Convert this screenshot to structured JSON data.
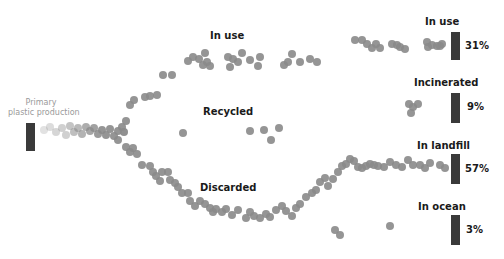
{
  "source": {
    "label_line1": "Primary",
    "label_line2": "plastic production"
  },
  "flow_labels": {
    "in_use": "In use",
    "recycled": "Recycled",
    "discarded": "Discarded"
  },
  "outcomes": [
    {
      "label": "In use",
      "percent": "31%"
    },
    {
      "label": "Incinerated",
      "percent": "9%"
    },
    {
      "label": "In landfill",
      "percent": "57%"
    },
    {
      "label": "In ocean",
      "percent": "3%"
    }
  ],
  "colors": {
    "bar": "#3a3a3a",
    "dot": "#8a8a8a",
    "label": "#1a1a1a",
    "source_label": "#9a9a9a"
  },
  "chart_data": {
    "type": "flow",
    "title": "",
    "source": "Primary plastic production",
    "paths": [
      "In use",
      "Recycled",
      "Discarded"
    ],
    "outcomes": [
      {
        "name": "In use",
        "value": 31
      },
      {
        "name": "Incinerated",
        "value": 9
      },
      {
        "name": "In landfill",
        "value": 57
      },
      {
        "name": "In ocean",
        "value": 3
      }
    ],
    "unit": "%"
  },
  "dots": [
    [
      44,
      130,
      0.25
    ],
    [
      50,
      127,
      0.3
    ],
    [
      56,
      132,
      0.35
    ],
    [
      62,
      128,
      0.4
    ],
    [
      66,
      135,
      0.4
    ],
    [
      70,
      126,
      0.5
    ],
    [
      74,
      132,
      0.55
    ],
    [
      78,
      128,
      0.6
    ],
    [
      82,
      134,
      0.65
    ],
    [
      86,
      127,
      0.7
    ],
    [
      90,
      131,
      0.75
    ],
    [
      94,
      128,
      0.8
    ],
    [
      98,
      134,
      0.85
    ],
    [
      102,
      130,
      0.9
    ],
    [
      106,
      135,
      0.9
    ],
    [
      110,
      129,
      0.9
    ],
    [
      114,
      136,
      0.9
    ],
    [
      118,
      131,
      0.9
    ],
    [
      122,
      127,
      0.9
    ],
    [
      124,
      132,
      0.95
    ],
    [
      126,
      121,
      0.9
    ],
    [
      130,
      105,
      0.9
    ],
    [
      134,
      100,
      0.9
    ],
    [
      145,
      97,
      0.9
    ],
    [
      150,
      96,
      0.9
    ],
    [
      157,
      95,
      0.9
    ],
    [
      163,
      75,
      0.9
    ],
    [
      172,
      75,
      0.9
    ],
    [
      188,
      61,
      0.9
    ],
    [
      193,
      57,
      0.9
    ],
    [
      199,
      59,
      0.9
    ],
    [
      203,
      65,
      0.9
    ],
    [
      205,
      53,
      0.9
    ],
    [
      207,
      62,
      0.9
    ],
    [
      210,
      66,
      0.9
    ],
    [
      228,
      57,
      0.9
    ],
    [
      230,
      67,
      0.9
    ],
    [
      233,
      59,
      0.9
    ],
    [
      238,
      62,
      0.9
    ],
    [
      242,
      53,
      0.9
    ],
    [
      250,
      60,
      0.9
    ],
    [
      258,
      66,
      0.9
    ],
    [
      260,
      57,
      0.9
    ],
    [
      284,
      65,
      0.9
    ],
    [
      288,
      62,
      0.9
    ],
    [
      292,
      54,
      0.9
    ],
    [
      300,
      62,
      0.9
    ],
    [
      310,
      59,
      0.9
    ],
    [
      317,
      62,
      0.9
    ],
    [
      355,
      40,
      0.9
    ],
    [
      362,
      40,
      0.9
    ],
    [
      367,
      44,
      0.9
    ],
    [
      372,
      48,
      0.9
    ],
    [
      376,
      44,
      0.9
    ],
    [
      380,
      48,
      0.9
    ],
    [
      392,
      44,
      0.9
    ],
    [
      397,
      45,
      0.9
    ],
    [
      400,
      47,
      0.9
    ],
    [
      405,
      49,
      0.9
    ],
    [
      427,
      42,
      0.9
    ],
    [
      428,
      47,
      0.9
    ],
    [
      432,
      45,
      0.9
    ],
    [
      437,
      46,
      0.9
    ],
    [
      440,
      46,
      0.9
    ],
    [
      442,
      44,
      0.9
    ],
    [
      183,
      133,
      0.9
    ],
    [
      250,
      131,
      0.9
    ],
    [
      264,
      130,
      0.9
    ],
    [
      271,
      140,
      0.9
    ],
    [
      279,
      128,
      0.9
    ],
    [
      409,
      104,
      0.9
    ],
    [
      413,
      107,
      0.9
    ],
    [
      418,
      104,
      0.9
    ],
    [
      411,
      113,
      0.9
    ],
    [
      118,
      140,
      0.9
    ],
    [
      126,
      147,
      0.9
    ],
    [
      130,
      152,
      0.9
    ],
    [
      133,
      148,
      0.9
    ],
    [
      137,
      154,
      0.9
    ],
    [
      142,
      165,
      0.9
    ],
    [
      150,
      166,
      0.9
    ],
    [
      153,
      172,
      0.9
    ],
    [
      156,
      176,
      0.9
    ],
    [
      160,
      181,
      0.9
    ],
    [
      162,
      172,
      0.9
    ],
    [
      168,
      172,
      0.9
    ],
    [
      170,
      180,
      0.9
    ],
    [
      175,
      183,
      0.9
    ],
    [
      178,
      187,
      0.9
    ],
    [
      182,
      193,
      0.9
    ],
    [
      188,
      193,
      0.9
    ],
    [
      190,
      201,
      0.9
    ],
    [
      195,
      206,
      0.9
    ],
    [
      200,
      201,
      0.9
    ],
    [
      205,
      204,
      0.9
    ],
    [
      210,
      208,
      0.9
    ],
    [
      213,
      212,
      0.9
    ],
    [
      216,
      209,
      0.9
    ],
    [
      222,
      212,
      0.9
    ],
    [
      226,
      209,
      0.9
    ],
    [
      232,
      215,
      0.9
    ],
    [
      238,
      210,
      0.9
    ],
    [
      246,
      218,
      0.9
    ],
    [
      250,
      212,
      0.9
    ],
    [
      254,
      216,
      0.9
    ],
    [
      260,
      218,
      0.9
    ],
    [
      266,
      214,
      0.9
    ],
    [
      270,
      217,
      0.9
    ],
    [
      276,
      210,
      0.9
    ],
    [
      282,
      206,
      0.9
    ],
    [
      286,
      211,
      0.9
    ],
    [
      292,
      216,
      0.9
    ],
    [
      296,
      208,
      0.9
    ],
    [
      300,
      204,
      0.9
    ],
    [
      306,
      197,
      0.9
    ],
    [
      312,
      193,
      0.9
    ],
    [
      316,
      190,
      0.9
    ],
    [
      320,
      182,
      0.9
    ],
    [
      325,
      178,
      0.9
    ],
    [
      328,
      186,
      0.9
    ],
    [
      333,
      179,
      0.9
    ],
    [
      338,
      172,
      0.9
    ],
    [
      342,
      166,
      0.9
    ],
    [
      346,
      164,
      0.9
    ],
    [
      350,
      159,
      0.9
    ],
    [
      354,
      161,
      0.9
    ],
    [
      358,
      167,
      0.9
    ],
    [
      362,
      168,
      0.9
    ],
    [
      366,
      166,
      0.9
    ],
    [
      370,
      164,
      0.9
    ],
    [
      374,
      165,
      0.9
    ],
    [
      378,
      166,
      0.9
    ],
    [
      384,
      167,
      0.9
    ],
    [
      390,
      162,
      0.9
    ],
    [
      396,
      165,
      0.9
    ],
    [
      402,
      167,
      0.9
    ],
    [
      408,
      160,
      0.9
    ],
    [
      413,
      165,
      0.9
    ],
    [
      420,
      165,
      0.9
    ],
    [
      425,
      168,
      0.9
    ],
    [
      430,
      163,
      0.9
    ],
    [
      440,
      165,
      0.9
    ],
    [
      445,
      168,
      0.9
    ],
    [
      335,
      230,
      0.9
    ],
    [
      340,
      235,
      0.9
    ],
    [
      390,
      226,
      0.9
    ]
  ]
}
